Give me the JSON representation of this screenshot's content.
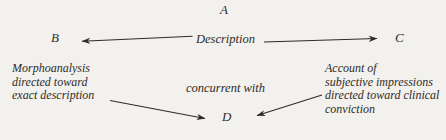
{
  "figure": {
    "type": "node-edge-diagram",
    "background_color": "#f3f1ed",
    "ink_color": "#2e2b27",
    "nodes": {
      "a": "A",
      "b": "B",
      "c": "C",
      "d": "D"
    },
    "edge_labels": {
      "description": "Description",
      "concurrent": "concurrent with"
    },
    "left_block": {
      "lines": [
        "Morphoanalysis",
        "directed toward",
        "exact description"
      ]
    },
    "right_block": {
      "lines": [
        "Account of",
        "subjective impressions",
        "directed toward clinical",
        "conviction"
      ]
    },
    "arrows": [
      {
        "name": "description-to-b",
        "from": "Description",
        "to": "B",
        "direction": "left"
      },
      {
        "name": "description-to-c",
        "from": "Description",
        "to": "C",
        "direction": "right"
      },
      {
        "name": "morphoanalysis-to-d",
        "from": "exact description",
        "to": "D",
        "direction": "down-right"
      },
      {
        "name": "account-to-d",
        "from": "subjective impressions",
        "to": "D",
        "direction": "down-left"
      }
    ]
  }
}
